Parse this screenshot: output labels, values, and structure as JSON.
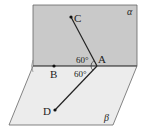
{
  "diagram": {
    "planes": [
      {
        "name": "alpha",
        "label": "α",
        "fill": "#c9c9c9"
      },
      {
        "name": "beta",
        "label": "β",
        "fill": "#ececec"
      }
    ],
    "points": [
      {
        "name": "A",
        "label": "A"
      },
      {
        "name": "B",
        "label": "B"
      },
      {
        "name": "C",
        "label": "C"
      },
      {
        "name": "D",
        "label": "D"
      }
    ],
    "angles": [
      {
        "between": "CA-AB",
        "label": "60°"
      },
      {
        "between": "DA-AB",
        "label": "60°"
      }
    ],
    "segments": [
      "CA",
      "AD"
    ],
    "edge_color": "#555555",
    "line_color": "#222222"
  }
}
